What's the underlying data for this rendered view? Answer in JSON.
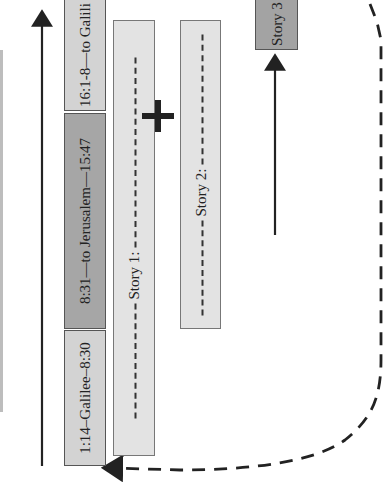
{
  "diagram": {
    "mark_sections": [
      {
        "label": "16:1-8—to Galili",
        "shade": "light"
      },
      {
        "label": "8:31—to Jerusalem—15:47",
        "shade": "dark"
      },
      {
        "label": "1:14–Galilee–8:30",
        "shade": "light"
      }
    ],
    "stories": [
      {
        "label": "Story 1:"
      },
      {
        "label": "Story 2:"
      },
      {
        "label": "Story 3"
      }
    ],
    "plus_symbol": "+",
    "colors": {
      "light_box": "#d3d3d3",
      "dark_box": "#a6a6a6",
      "story_box": "#e3e3e3",
      "line": "#222222"
    }
  }
}
